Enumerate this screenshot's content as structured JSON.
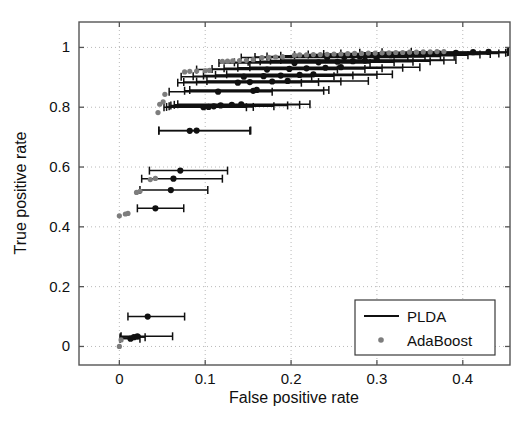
{
  "figure": {
    "background_color": "#ffffff",
    "plot_area": {
      "left": 79,
      "top": 22,
      "right": 510,
      "bottom": 365
    }
  },
  "chart_data": {
    "type": "line",
    "title": "",
    "subtitle": "",
    "xlabel": "False positive rate",
    "ylabel": "True positive rate",
    "xlim": [
      -0.047,
      0.455
    ],
    "ylim": [
      -0.062,
      1.085
    ],
    "xticks": [
      0,
      0.1,
      0.2,
      0.3,
      0.4
    ],
    "xtick_labels": [
      "0",
      "0.1",
      "0.2",
      "0.3",
      "0.4"
    ],
    "yticks": [
      0,
      0.2,
      0.4,
      0.6,
      0.8,
      1
    ],
    "ytick_labels": [
      "0",
      "0.2",
      "0.4",
      "0.6",
      "0.8",
      "1"
    ],
    "grid": true,
    "grid_style": "dotted",
    "grid_color": "#b9b9b9",
    "axis_color": "#555555",
    "legend_position": "lower right",
    "series": [
      {
        "name": "PLDA",
        "color": "#101010",
        "style": "errorbar-line",
        "marker": "dot",
        "points": [
          {
            "x": 0.013,
            "y": 0.026,
            "xlo": 0.001,
            "xhi": 0.024
          },
          {
            "x": 0.017,
            "y": 0.031,
            "xlo": 0.001,
            "xhi": 0.03
          },
          {
            "x": 0.021,
            "y": 0.034,
            "xlo": 0.002,
            "xhi": 0.062
          },
          {
            "x": 0.033,
            "y": 0.1,
            "xlo": 0.01,
            "xhi": 0.076
          },
          {
            "x": 0.042,
            "y": 0.462,
            "xlo": 0.021,
            "xhi": 0.075
          },
          {
            "x": 0.06,
            "y": 0.523,
            "xlo": 0.024,
            "xhi": 0.103
          },
          {
            "x": 0.063,
            "y": 0.561,
            "xlo": 0.026,
            "xhi": 0.12
          },
          {
            "x": 0.071,
            "y": 0.588,
            "xlo": 0.035,
            "xhi": 0.126
          },
          {
            "x": 0.082,
            "y": 0.721,
            "xlo": 0.046,
            "xhi": 0.152
          },
          {
            "x": 0.09,
            "y": 0.722,
            "xlo": 0.046,
            "xhi": 0.153
          },
          {
            "x": 0.098,
            "y": 0.8,
            "xlo": 0.052,
            "xhi": 0.148
          },
          {
            "x": 0.104,
            "y": 0.801,
            "xlo": 0.055,
            "xhi": 0.156
          },
          {
            "x": 0.11,
            "y": 0.803,
            "xlo": 0.058,
            "xhi": 0.18
          },
          {
            "x": 0.118,
            "y": 0.806,
            "xlo": 0.06,
            "xhi": 0.196
          },
          {
            "x": 0.131,
            "y": 0.808,
            "xlo": 0.064,
            "xhi": 0.21
          },
          {
            "x": 0.142,
            "y": 0.81,
            "xlo": 0.068,
            "xhi": 0.222
          },
          {
            "x": 0.115,
            "y": 0.852,
            "xlo": 0.058,
            "xhi": 0.178
          },
          {
            "x": 0.156,
            "y": 0.855,
            "xlo": 0.076,
            "xhi": 0.238
          },
          {
            "x": 0.16,
            "y": 0.858,
            "xlo": 0.082,
            "xhi": 0.244
          },
          {
            "x": 0.138,
            "y": 0.882,
            "xlo": 0.068,
            "xhi": 0.212
          },
          {
            "x": 0.152,
            "y": 0.884,
            "xlo": 0.075,
            "xhi": 0.232
          },
          {
            "x": 0.178,
            "y": 0.886,
            "xlo": 0.09,
            "xhi": 0.258
          },
          {
            "x": 0.196,
            "y": 0.888,
            "xlo": 0.102,
            "xhi": 0.29
          },
          {
            "x": 0.145,
            "y": 0.902,
            "xlo": 0.072,
            "xhi": 0.224
          },
          {
            "x": 0.168,
            "y": 0.904,
            "xlo": 0.086,
            "xhi": 0.25
          },
          {
            "x": 0.188,
            "y": 0.906,
            "xlo": 0.098,
            "xhi": 0.272
          },
          {
            "x": 0.21,
            "y": 0.908,
            "xlo": 0.112,
            "xhi": 0.3
          },
          {
            "x": 0.226,
            "y": 0.91,
            "xlo": 0.125,
            "xhi": 0.318
          },
          {
            "x": 0.172,
            "y": 0.926,
            "xlo": 0.09,
            "xhi": 0.254
          },
          {
            "x": 0.198,
            "y": 0.928,
            "xlo": 0.108,
            "xhi": 0.286
          },
          {
            "x": 0.218,
            "y": 0.93,
            "xlo": 0.122,
            "xhi": 0.306
          },
          {
            "x": 0.24,
            "y": 0.932,
            "xlo": 0.138,
            "xhi": 0.33
          },
          {
            "x": 0.258,
            "y": 0.934,
            "xlo": 0.152,
            "xhi": 0.35
          },
          {
            "x": 0.204,
            "y": 0.948,
            "xlo": 0.116,
            "xhi": 0.292
          },
          {
            "x": 0.232,
            "y": 0.95,
            "xlo": 0.134,
            "xhi": 0.32
          },
          {
            "x": 0.254,
            "y": 0.952,
            "xlo": 0.15,
            "xhi": 0.342
          },
          {
            "x": 0.272,
            "y": 0.954,
            "xlo": 0.164,
            "xhi": 0.362
          },
          {
            "x": 0.286,
            "y": 0.956,
            "xlo": 0.176,
            "xhi": 0.378
          },
          {
            "x": 0.3,
            "y": 0.958,
            "xlo": 0.188,
            "xhi": 0.392
          },
          {
            "x": 0.242,
            "y": 0.966,
            "xlo": 0.142,
            "xhi": 0.336
          },
          {
            "x": 0.262,
            "y": 0.968,
            "xlo": 0.158,
            "xhi": 0.356
          },
          {
            "x": 0.28,
            "y": 0.97,
            "xlo": 0.172,
            "xhi": 0.374
          },
          {
            "x": 0.298,
            "y": 0.972,
            "xlo": 0.188,
            "xhi": 0.39
          },
          {
            "x": 0.316,
            "y": 0.974,
            "xlo": 0.204,
            "xhi": 0.406
          },
          {
            "x": 0.334,
            "y": 0.976,
            "xlo": 0.22,
            "xhi": 0.42
          },
          {
            "x": 0.352,
            "y": 0.978,
            "xlo": 0.238,
            "xhi": 0.432
          },
          {
            "x": 0.372,
            "y": 0.98,
            "xlo": 0.258,
            "xhi": 0.442
          },
          {
            "x": 0.392,
            "y": 0.982,
            "xlo": 0.28,
            "xhi": 0.45
          },
          {
            "x": 0.412,
            "y": 0.984,
            "xlo": 0.306,
            "xhi": 0.452
          },
          {
            "x": 0.43,
            "y": 0.985,
            "xlo": 0.34,
            "xhi": 0.453
          }
        ]
      },
      {
        "name": "AdaBoost",
        "color": "#7d7d7d",
        "style": "marker",
        "marker": "dot",
        "points": [
          {
            "x": 0.0,
            "y": 0.0
          },
          {
            "x": 0.002,
            "y": 0.022
          },
          {
            "x": 0.0,
            "y": 0.437
          },
          {
            "x": 0.007,
            "y": 0.443
          },
          {
            "x": 0.01,
            "y": 0.445
          },
          {
            "x": 0.02,
            "y": 0.515
          },
          {
            "x": 0.024,
            "y": 0.519
          },
          {
            "x": 0.036,
            "y": 0.558
          },
          {
            "x": 0.042,
            "y": 0.562
          },
          {
            "x": 0.045,
            "y": 0.782
          },
          {
            "x": 0.047,
            "y": 0.81
          },
          {
            "x": 0.051,
            "y": 0.818
          },
          {
            "x": 0.053,
            "y": 0.843
          },
          {
            "x": 0.076,
            "y": 0.918
          },
          {
            "x": 0.082,
            "y": 0.92
          },
          {
            "x": 0.09,
            "y": 0.921
          },
          {
            "x": 0.1,
            "y": 0.922
          },
          {
            "x": 0.105,
            "y": 0.923
          },
          {
            "x": 0.12,
            "y": 0.953
          },
          {
            "x": 0.126,
            "y": 0.954
          },
          {
            "x": 0.132,
            "y": 0.955
          },
          {
            "x": 0.14,
            "y": 0.956
          },
          {
            "x": 0.148,
            "y": 0.957
          },
          {
            "x": 0.156,
            "y": 0.959
          },
          {
            "x": 0.166,
            "y": 0.966
          },
          {
            "x": 0.174,
            "y": 0.967
          },
          {
            "x": 0.182,
            "y": 0.968
          },
          {
            "x": 0.19,
            "y": 0.969
          },
          {
            "x": 0.204,
            "y": 0.974
          },
          {
            "x": 0.21,
            "y": 0.975
          },
          {
            "x": 0.218,
            "y": 0.975
          },
          {
            "x": 0.226,
            "y": 0.976
          },
          {
            "x": 0.234,
            "y": 0.976
          },
          {
            "x": 0.242,
            "y": 0.977
          },
          {
            "x": 0.25,
            "y": 0.978
          },
          {
            "x": 0.258,
            "y": 0.978
          },
          {
            "x": 0.266,
            "y": 0.979
          },
          {
            "x": 0.274,
            "y": 0.98
          },
          {
            "x": 0.282,
            "y": 0.98
          },
          {
            "x": 0.29,
            "y": 0.981
          },
          {
            "x": 0.298,
            "y": 0.981
          },
          {
            "x": 0.306,
            "y": 0.982
          },
          {
            "x": 0.314,
            "y": 0.982
          },
          {
            "x": 0.322,
            "y": 0.983
          },
          {
            "x": 0.33,
            "y": 0.983
          },
          {
            "x": 0.338,
            "y": 0.984
          },
          {
            "x": 0.346,
            "y": 0.984
          },
          {
            "x": 0.354,
            "y": 0.985
          },
          {
            "x": 0.362,
            "y": 0.985
          },
          {
            "x": 0.37,
            "y": 0.986
          },
          {
            "x": 0.378,
            "y": 0.986
          }
        ]
      }
    ],
    "legend": {
      "entries": [
        {
          "label": "PLDA",
          "marker": "line",
          "color": "#101010"
        },
        {
          "label": "AdaBoost",
          "marker": "dot",
          "color": "#7d7d7d"
        }
      ],
      "box": {
        "left": 355,
        "top": 300,
        "width": 140,
        "height": 55
      }
    }
  }
}
